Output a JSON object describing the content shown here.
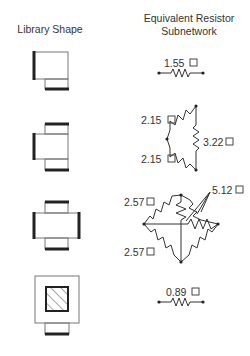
{
  "headers": {
    "left": "Library Shape",
    "right_line1": "Equivalent Resistor",
    "right_line2": "Subnetwork"
  },
  "rows": [
    {
      "shape": "L-shaped block (one side port, one bottom port)",
      "resistors": [
        {
          "value": "1.55",
          "unit_symbol": "□"
        }
      ]
    },
    {
      "shape": "T-shaped block (left port, top and bottom ports)",
      "resistors": [
        {
          "value": "2.15",
          "unit_symbol": "□"
        },
        {
          "value": "2.15",
          "unit_symbol": "□"
        },
        {
          "value": "3.22",
          "unit_symbol": "□"
        }
      ]
    },
    {
      "shape": "Cross-shaped block (four ports)",
      "resistors": [
        {
          "value": "2.57",
          "unit_symbol": "□"
        },
        {
          "value": "2.57",
          "unit_symbol": "□"
        },
        {
          "value": "5.12",
          "unit_symbol": "□"
        }
      ]
    },
    {
      "shape": "Square block with hatched contact and bottom port",
      "resistors": [
        {
          "value": "0.89",
          "unit_symbol": "□"
        }
      ]
    }
  ],
  "labels": {
    "r1": "1.55",
    "r2a": "2.15",
    "r2b": "2.15",
    "r2c": "3.22",
    "r3a": "2.57",
    "r3b": "2.57",
    "r3c": "5.12",
    "r4": "0.89"
  }
}
